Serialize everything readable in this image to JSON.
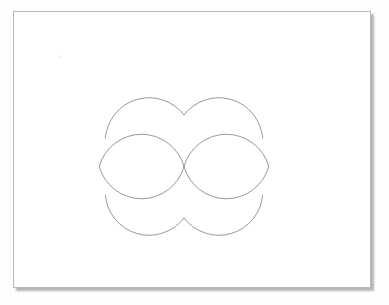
{
  "scene": {
    "title": "Geometric line drawing on white card",
    "background_color": "#fefefe"
  },
  "card": {
    "name": "paper-sheet",
    "fill_color": "#ffffff",
    "border_color": "#b9b9b9",
    "shadow_color": "#5a5a5a",
    "x": 13,
    "y": 11,
    "width": 358,
    "height": 277
  },
  "figure": {
    "stroke_color": "#8a8a8a",
    "stroke_width": 0.9,
    "circle_radius": 44,
    "centers": [
      {
        "label": "top-left-circle",
        "cx": 140,
        "cy": 125
      },
      {
        "label": "top-right-circle",
        "cx": 228,
        "cy": 125
      },
      {
        "label": "bottom-left-circle",
        "cx": 140,
        "cy": 208
      },
      {
        "label": "bottom-right-circle",
        "cx": 228,
        "cy": 208
      }
    ],
    "paths": [
      {
        "name": "top-left-upper-arc",
        "d": "M 105.3 137.9 A 44 44 0 0 1 184 114.9"
      },
      {
        "name": "top-right-upper-arc",
        "d": "M 184 114.9 A 44 44 0 0 1 262.7 137.9"
      },
      {
        "name": "left-lens-upper-edge",
        "d": "M 99.2 166.5 A 44 44 0 0 1 184 166.5"
      },
      {
        "name": "left-lens-lower-edge",
        "d": "M 99.2 166.5 A 44 44 0 0 0 184 166.5"
      },
      {
        "name": "right-lens-upper-edge",
        "d": "M 184 166.5 A 44 44 0 0 1 268.8 166.5"
      },
      {
        "name": "right-lens-lower-edge",
        "d": "M 184 166.5 A 44 44 0 0 0 268.8 166.5"
      },
      {
        "name": "bottom-left-lower-arc",
        "d": "M 105.3 195.1 A 44 44 0 0 0 184 218.1"
      },
      {
        "name": "bottom-right-lower-arc",
        "d": "M 184 218.1 A 44 44 0 0 0 262.7 195.1"
      }
    ],
    "cusps": [
      {
        "label": "top-cusp",
        "x": 184,
        "y": 125
      },
      {
        "label": "center-crossing",
        "x": 184,
        "y": 166
      },
      {
        "label": "bottom-cusp",
        "x": 184,
        "y": 208
      }
    ]
  }
}
